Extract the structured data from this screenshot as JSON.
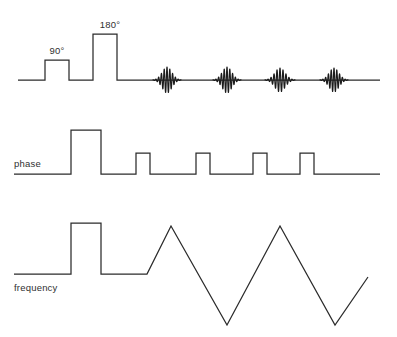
{
  "figure": {
    "width": 397,
    "height": 337,
    "background_color": "#ffffff",
    "line_color": "#2b2b2b"
  },
  "rows": [
    {
      "id": "rf",
      "name": "rf-channel",
      "label": "",
      "baseline_y": 80,
      "start_x": 18,
      "end_x": 380
    },
    {
      "id": "phase",
      "name": "phase-channel",
      "label": "phase",
      "label_x": 14,
      "label_y": 167,
      "baseline_y": 174,
      "start_x": 14,
      "end_x": 380
    },
    {
      "id": "frequency",
      "name": "frequency-channel",
      "label": "frequency",
      "label_x": 14,
      "label_y": 291,
      "baseline_y": 274,
      "start_x": 14,
      "end_x": 368
    }
  ],
  "rf_pulses": [
    {
      "label": "90°",
      "x_start": 45,
      "x_end": 69,
      "top_y": 60,
      "label_x": 57,
      "label_y": 54
    },
    {
      "label": "180°",
      "x_start": 93,
      "x_end": 117,
      "top_y": 34,
      "label_x": 110,
      "label_y": 28
    }
  ],
  "echoes": [
    {
      "name": "echo-1",
      "center_x": 167,
      "half_width": 14,
      "amplitude": 13,
      "cycles": 10
    },
    {
      "name": "echo-2",
      "center_x": 227,
      "half_width": 14,
      "amplitude": 13,
      "cycles": 10
    },
    {
      "name": "echo-3",
      "center_x": 280,
      "half_width": 15,
      "amplitude": 12,
      "cycles": 10
    },
    {
      "name": "echo-4",
      "center_x": 334,
      "half_width": 14,
      "amplitude": 12,
      "cycles": 10
    }
  ],
  "phase_pulses": [
    {
      "name": "phase-pulse-tall",
      "x_start": 71,
      "x_end": 101,
      "top_y": 130
    },
    {
      "name": "phase-pulse-1",
      "x_start": 136,
      "x_end": 150,
      "top_y": 153
    },
    {
      "name": "phase-pulse-2",
      "x_start": 196,
      "x_end": 210,
      "top_y": 153
    },
    {
      "name": "phase-pulse-3",
      "x_start": 253,
      "x_end": 267,
      "top_y": 153
    },
    {
      "name": "phase-pulse-4",
      "x_start": 300,
      "x_end": 314,
      "top_y": 153
    }
  ],
  "frequency_pulse": {
    "name": "frequency-prephase-pulse",
    "x_start": 71,
    "x_end": 101,
    "top_y": 223
  },
  "frequency_zigzag": {
    "name": "frequency-readout-zigzag",
    "points": [
      {
        "x": 147,
        "y": 274
      },
      {
        "x": 171,
        "y": 226
      },
      {
        "x": 227,
        "y": 325
      },
      {
        "x": 280,
        "y": 226
      },
      {
        "x": 335,
        "y": 325
      },
      {
        "x": 368,
        "y": 277
      }
    ]
  },
  "chart_data": {
    "type": "line",
    "xlabel": "",
    "ylabel": "",
    "series": [
      {
        "name": "RF",
        "label": "",
        "events": [
          {
            "type": "rect-pulse",
            "label": "90°",
            "x_start": 45,
            "x_end": 69,
            "amplitude": 20
          },
          {
            "type": "rect-pulse",
            "label": "180°",
            "x_start": 93,
            "x_end": 117,
            "amplitude": 46
          },
          {
            "type": "echo",
            "label": "echo 1",
            "center": 167,
            "amplitude": 13
          },
          {
            "type": "echo",
            "label": "echo 2",
            "center": 227,
            "amplitude": 13
          },
          {
            "type": "echo",
            "label": "echo 3",
            "center": 280,
            "amplitude": 12
          },
          {
            "type": "echo",
            "label": "echo 4",
            "center": 334,
            "amplitude": 12
          }
        ]
      },
      {
        "name": "phase",
        "label": "phase",
        "events": [
          {
            "type": "rect-pulse",
            "x_start": 71,
            "x_end": 101,
            "amplitude": 44
          },
          {
            "type": "rect-pulse",
            "x_start": 136,
            "x_end": 150,
            "amplitude": 21
          },
          {
            "type": "rect-pulse",
            "x_start": 196,
            "x_end": 210,
            "amplitude": 21
          },
          {
            "type": "rect-pulse",
            "x_start": 253,
            "x_end": 267,
            "amplitude": 21
          },
          {
            "type": "rect-pulse",
            "x_start": 300,
            "x_end": 314,
            "amplitude": 21
          }
        ]
      },
      {
        "name": "frequency",
        "label": "frequency",
        "events": [
          {
            "type": "rect-pulse",
            "x_start": 71,
            "x_end": 101,
            "amplitude": 51
          },
          {
            "type": "zigzag",
            "peaks": 2,
            "valleys": 2,
            "amplitude_up": 48,
            "amplitude_down": -51
          }
        ]
      }
    ],
    "grid": false,
    "legend": "none"
  }
}
